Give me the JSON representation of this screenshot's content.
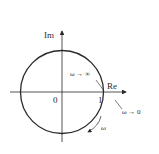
{
  "diagram": {
    "type": "nyquist-plot",
    "axes": {
      "imaginary_label": "Im",
      "real_label": "Re"
    },
    "tick_labels": {
      "origin": "0",
      "one": "1"
    },
    "annotations": {
      "omega_infinity": "ω → ∞",
      "omega_zero": "ω → 0",
      "omega_direction": "ω"
    },
    "shape": {
      "kind": "circle",
      "center": [
        0,
        0
      ],
      "radius": 1,
      "description": "unit circle"
    },
    "colors": {
      "stroke": "#2a2a2a",
      "background": "#ffffff"
    }
  }
}
